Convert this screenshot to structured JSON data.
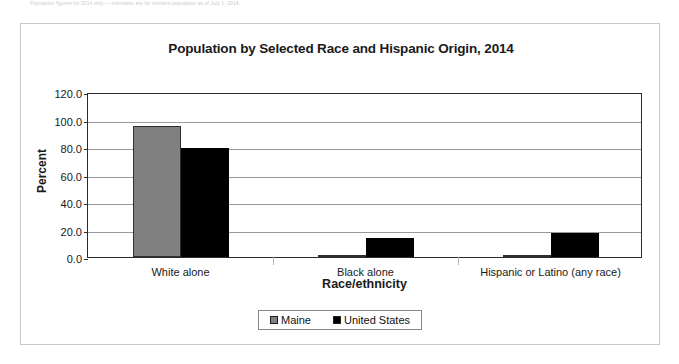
{
  "top_caption": "Population figures for 2014 only — estimates are for resident population as of July 1, 2014.",
  "chart_data": {
    "type": "bar",
    "title": "Population by Selected Race and Hispanic Origin, 2014",
    "xlabel": "Race/ethnicity",
    "ylabel": "Percent",
    "categories": [
      "White alone",
      "Black alone",
      "Hispanic or Latino (any race)"
    ],
    "series": [
      {
        "name": "Maine",
        "color": "#808080",
        "values": [
          95.5,
          1.5,
          1.6
        ]
      },
      {
        "name": "United States",
        "color": "#000000",
        "values": [
          79.0,
          14.0,
          17.3
        ]
      }
    ],
    "ylim": [
      0,
      120
    ],
    "yticks": [
      "0.0",
      "20.0",
      "40.0",
      "60.0",
      "80.0",
      "100.0",
      "120.0"
    ],
    "ytick_values": [
      0,
      20,
      40,
      60,
      80,
      100,
      120
    ],
    "grid": true,
    "legend_position": "bottom"
  }
}
